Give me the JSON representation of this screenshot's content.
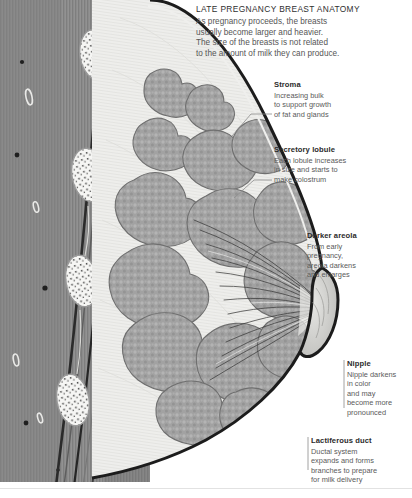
{
  "heading": {
    "title": "LATE PREGNANCY BREAST ANATOMY",
    "body_lines": [
      "As pregnancy proceeds, the breasts",
      "usually become larger and heavier.",
      "The size of the breasts is not related",
      "to the amount of milk they can produce."
    ]
  },
  "callouts": [
    {
      "id": "stroma",
      "title": "Stroma",
      "body_lines": [
        "Increasing bulk",
        "to support growth",
        "of fat and glands"
      ]
    },
    {
      "id": "secretory-lobule",
      "title": "Secretory lobule",
      "body_lines": [
        "Each lobule increases",
        "in size and starts to",
        "make colostrum"
      ]
    },
    {
      "id": "darker-areola",
      "title": "Darker areola",
      "body_lines": [
        "From early",
        "pregnancy,",
        "areola darkens",
        "and enlarges"
      ]
    },
    {
      "id": "nipple",
      "title": "Nipple",
      "body_lines": [
        "Nipple darkens",
        "in color",
        "and may",
        "become more",
        "pronounced"
      ]
    },
    {
      "id": "lactiferous-duct",
      "title": "Lactiferous duct",
      "body_lines": [
        "Ductal system",
        "expands and forms",
        "branches to prepare",
        "for milk delivery"
      ]
    }
  ],
  "illustration": {
    "name": "sagittal-cross-section-of-lactating-breast",
    "parts": [
      "chest-wall-muscle",
      "rib-cross-sections",
      "pectoral-fascia",
      "adipose-stroma",
      "secretory-lobules",
      "lactiferous-ducts",
      "areola",
      "nipple"
    ]
  },
  "colors": {
    "muscle": "#8a8a8a",
    "rib_bone": "#f4f4f2",
    "fascia": "#3a3a3a",
    "stroma": "#ececea",
    "lobule": "#9d9d9d",
    "skin_outline": "#1e1e1e",
    "leader_line": "#8c8c8c",
    "title_text": "#2f2f2f",
    "body_text": "#5a5a5a"
  }
}
